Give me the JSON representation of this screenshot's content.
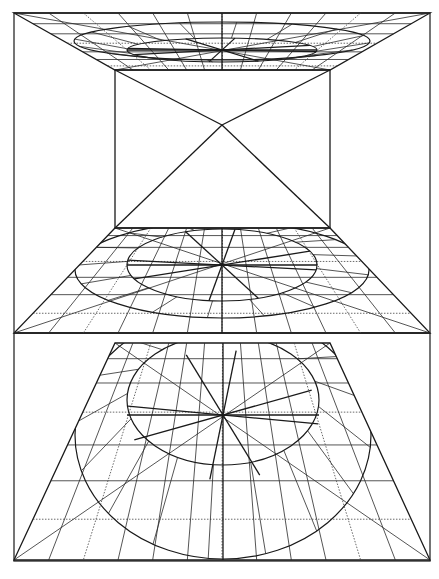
{
  "figure": {
    "caption_clipped": "",
    "frame": {
      "x1": 14,
      "y1": 13,
      "x2": 430,
      "y2": 561,
      "divider_y": 333
    },
    "colors": {
      "ink": "#1a1a1a",
      "paper": "#ffffff",
      "frame": "#3a3a3a"
    },
    "top_trapezoid": {
      "top": {
        "y": 13,
        "x1": 14,
        "x2": 430
      },
      "bottom": {
        "y": 70,
        "x1": 115,
        "x2": 330
      },
      "outer_ellipse": {
        "cx": 222,
        "cy": 41,
        "rx": 148,
        "ry": 19
      },
      "inner_ellipse": {
        "cx": 222,
        "cy": 50,
        "rx": 95,
        "ry": 12
      },
      "center": {
        "x": 222,
        "y": 50
      }
    },
    "middle_rectangle": {
      "x1": 115,
      "y1": 70,
      "x2": 330,
      "y2": 228,
      "diagonal_cross": {
        "x": 222,
        "y": 125
      }
    },
    "middle_trapezoid": {
      "top": {
        "y": 228,
        "x1": 115,
        "x2": 330
      },
      "bottom": {
        "y": 333,
        "x1": 14,
        "x2": 430
      },
      "outer_ellipse": {
        "cx": 222,
        "cy": 270,
        "rx": 147,
        "ry": 48
      },
      "inner_ellipse": {
        "cx": 222,
        "cy": 265,
        "rx": 95,
        "ry": 36
      },
      "center": {
        "x": 222,
        "y": 265
      }
    },
    "bottom_trapezoid": {
      "top": {
        "y": 343,
        "x1": 115,
        "x2": 330
      },
      "bottom": {
        "y": 560,
        "x1": 14,
        "x2": 430
      },
      "outer_ellipse": {
        "cx": 223,
        "cy": 435,
        "rx": 148,
        "ry": 124
      },
      "inner_ellipse": {
        "cx": 223,
        "cy": 400,
        "rx": 96,
        "ry": 65
      },
      "center": {
        "x": 223,
        "y": 415
      }
    }
  }
}
